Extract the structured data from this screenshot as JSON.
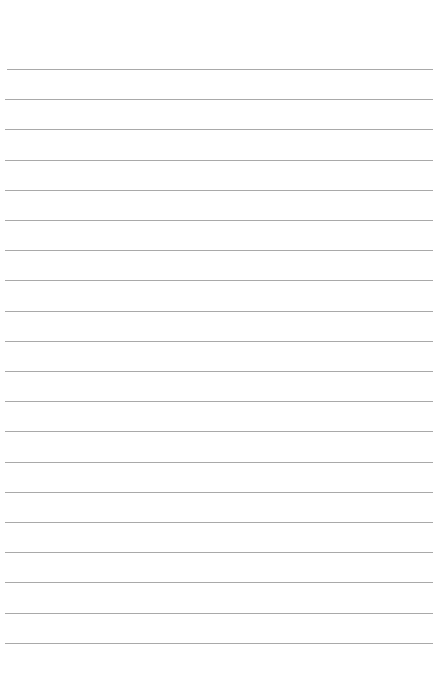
{
  "page": {
    "type": "lined-paper",
    "background_color": "#ffffff",
    "rule_color": "#a9a9a9",
    "rule_count": 20,
    "first_rule_y": 69,
    "rule_spacing": 30.2,
    "rule_left": 5,
    "rule_right": 433
  }
}
